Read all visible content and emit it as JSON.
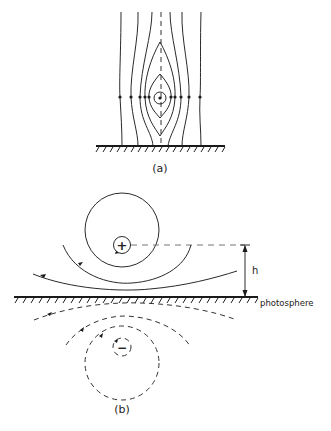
{
  "figure": {
    "panel_a": {
      "label": "(a)",
      "center_symbol": "dot",
      "description": "Closed field-line O-point with vertical field lines above a surface"
    },
    "panel_b": {
      "label": "(b)",
      "upper_charge_symbol": "+",
      "image_charge_symbol": "−",
      "height_label": "h",
      "surface_label": "photosphere"
    },
    "colors": {
      "line": "#2a2a2a",
      "background": "#ffffff"
    }
  }
}
